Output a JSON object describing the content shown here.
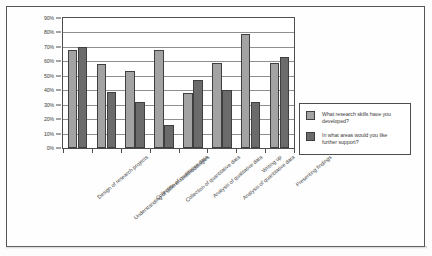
{
  "chart_data": {
    "type": "bar",
    "title": "",
    "xlabel": "",
    "ylabel": "",
    "ylim": [
      0,
      90
    ],
    "ytick_labels": [
      "90%",
      "80%",
      "70%",
      "60%",
      "50%",
      "40%",
      "30%",
      "20%",
      "10%",
      "0%"
    ],
    "ytick_values": [
      90,
      80,
      70,
      60,
      50,
      40,
      30,
      20,
      10,
      0
    ],
    "grid": true,
    "legend_position": "right",
    "categories": [
      "Design of research projects",
      "Understanding of different methodologies",
      "Collection of qualitative data",
      "Collection of quantitative data",
      "Analysis  of qualitative data",
      "Analysis  of quantitative data",
      "Writing up",
      "Presenting findings"
    ],
    "series": [
      {
        "name": "What research skills have you developed?",
        "color": "#a3a3a3",
        "values": [
          68,
          58,
          53,
          68,
          38,
          59,
          79,
          59
        ]
      },
      {
        "name": "In what areas would you like further support?",
        "color": "#6b6b6b",
        "values": [
          70,
          39,
          32,
          16,
          47,
          40,
          32,
          63
        ]
      }
    ]
  }
}
